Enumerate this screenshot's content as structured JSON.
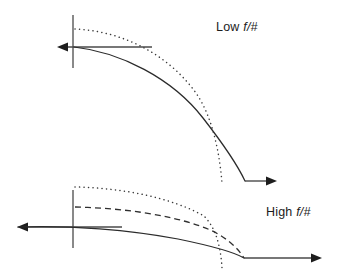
{
  "figure": {
    "background_color": "#ffffff",
    "width": 340,
    "height": 279,
    "panels": [
      {
        "id": "low-f-number",
        "label": "Low f/#",
        "label_position": {
          "x": 216,
          "y": 20
        },
        "vertical_axis": {
          "x": 73,
          "y_top": 15,
          "y_bottom": 68
        },
        "horizontal_arrow_left": {
          "from": {
            "x": 150,
            "y": 47
          },
          "to": {
            "x": 57,
            "y": 47
          },
          "direction": "left"
        },
        "horizontal_arrow_right": {
          "from": {
            "x": 245,
            "y": 181
          },
          "to": {
            "x": 277,
            "y": 181
          },
          "direction": "right"
        },
        "curves": [
          {
            "name": "sagittal-curve",
            "style": "solid",
            "start": {
              "x": 74,
              "y": 47
            },
            "end": {
              "x": 245,
              "y": 181
            }
          },
          {
            "name": "tangential-curve",
            "style": "dotted",
            "start": {
              "x": 75,
              "y": 29
            },
            "end": {
              "x": 222,
              "y": 183
            }
          }
        ]
      },
      {
        "id": "high-f-number",
        "label": "High f/#",
        "label_position": {
          "x": 266,
          "y": 205
        },
        "vertical_axis": {
          "x": 73,
          "y_top": 190,
          "y_bottom": 248
        },
        "horizontal_arrow_left": {
          "from": {
            "x": 120,
            "y": 227
          },
          "to": {
            "x": 17,
            "y": 227
          },
          "direction": "left"
        },
        "horizontal_arrow_right": {
          "from": {
            "x": 244,
            "y": 258
          },
          "to": {
            "x": 322,
            "y": 258
          },
          "direction": "right"
        },
        "curves": [
          {
            "name": "sagittal-curve",
            "style": "solid",
            "start": {
              "x": 18,
              "y": 227
            },
            "end": {
              "x": 244,
              "y": 258
            }
          },
          {
            "name": "median-curve",
            "style": "dashed",
            "start": {
              "x": 75,
              "y": 207
            },
            "end": {
              "x": 244,
              "y": 258
            }
          },
          {
            "name": "tangential-curve",
            "style": "dotted",
            "start": {
              "x": 75,
              "y": 187
            },
            "end": {
              "x": 222,
              "y": 268
            }
          }
        ]
      }
    ]
  },
  "labels": {
    "low_f_number": {
      "text": "Low ",
      "italic_part": "f/#"
    },
    "high_f_number": {
      "text": "High ",
      "italic_part": "f/#"
    }
  }
}
